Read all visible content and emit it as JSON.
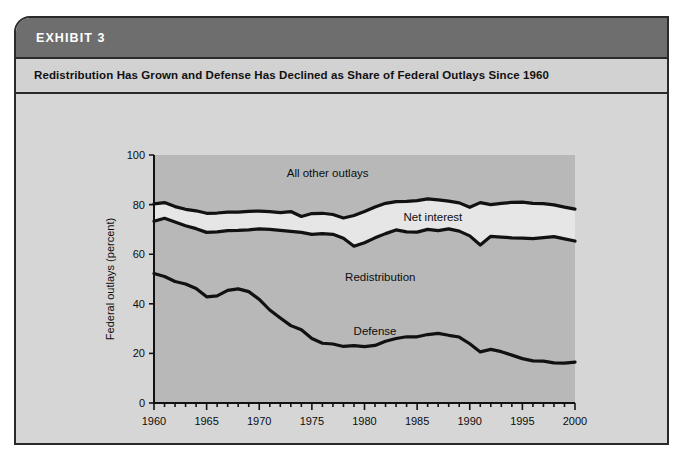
{
  "exhibit": {
    "label": "EXHIBIT 3",
    "subtitle": "Redistribution Has Grown and Defense Has Declined as Share of Federal Outlays Since 1960"
  },
  "colors": {
    "card_background": "#d6d6d6",
    "header_bar": "#6e6e6e",
    "subtitle_bar": "#d2d2d2",
    "border": "#2a2a2a",
    "plot_background": "#b8b8b8",
    "band_fill": "#e6e6e6",
    "line": "#111111",
    "header_text": "#ffffff",
    "body_text": "#111111"
  },
  "chart_data": {
    "type": "area",
    "title": "Redistribution Has Grown and Defense Has Declined as Share of Federal Outlays Since 1960",
    "xlabel": "",
    "ylabel": "Federal outlays (percent)",
    "xlim": [
      1960,
      2000
    ],
    "ylim": [
      0,
      100
    ],
    "grid": false,
    "legend_position": "inline-annotations",
    "x_tick_labels": [
      "1960",
      "1965",
      "1970",
      "1975",
      "1980",
      "1985",
      "1990",
      "1995",
      "2000"
    ],
    "x_tick_values": [
      1960,
      1965,
      1970,
      1975,
      1980,
      1985,
      1990,
      1995,
      2000
    ],
    "x_minor_tick_interval": 1,
    "y_tick_labels": [
      "0",
      "20",
      "40",
      "60",
      "80",
      "100"
    ],
    "y_tick_values": [
      0,
      20,
      40,
      60,
      80,
      100
    ],
    "annotations": [
      {
        "text": "All other outlays",
        "x": 1976.5,
        "y": 91
      },
      {
        "text": "Net interest",
        "x": 1986.5,
        "y": 73.5
      },
      {
        "text": "Redistribution",
        "x": 1981.5,
        "y": 49
      },
      {
        "text": "Defense",
        "x": 1981.0,
        "y": 27.5
      }
    ],
    "x": [
      1960,
      1961,
      1962,
      1963,
      1964,
      1965,
      1966,
      1967,
      1968,
      1969,
      1970,
      1971,
      1972,
      1973,
      1974,
      1975,
      1976,
      1977,
      1978,
      1979,
      1980,
      1981,
      1982,
      1983,
      1984,
      1985,
      1986,
      1987,
      1988,
      1989,
      1990,
      1991,
      1992,
      1993,
      1994,
      1995,
      1996,
      1997,
      1998,
      1999,
      2000
    ],
    "series": [
      {
        "name": "Defense",
        "description": "Defense share of federal outlays (cumulative bottom band)",
        "values": [
          52.2,
          51.0,
          49.0,
          48.0,
          46.2,
          42.8,
          43.2,
          45.4,
          46.0,
          44.9,
          41.8,
          37.5,
          34.3,
          31.2,
          29.5,
          26.0,
          24.1,
          23.8,
          22.8,
          23.1,
          22.7,
          23.2,
          24.9,
          26.0,
          26.7,
          26.7,
          27.6,
          28.1,
          27.3,
          26.6,
          23.9,
          20.6,
          21.6,
          20.7,
          19.3,
          17.9,
          17.0,
          16.9,
          16.2,
          16.1,
          16.5
        ]
      },
      {
        "name": "Redistribution",
        "description": "Cumulative top of Redistribution band (Defense + Redistribution)",
        "values": [
          73.3,
          74.5,
          73.0,
          71.5,
          70.3,
          68.8,
          69.0,
          69.5,
          69.6,
          69.8,
          70.2,
          70.0,
          69.6,
          69.2,
          68.8,
          68.0,
          68.3,
          68.0,
          66.4,
          63.2,
          64.6,
          66.6,
          68.3,
          69.8,
          69.0,
          68.9,
          70.0,
          69.5,
          70.2,
          69.3,
          67.4,
          63.7,
          67.2,
          66.9,
          66.6,
          66.5,
          66.3,
          66.7,
          67.1,
          66.2,
          65.3
        ]
      },
      {
        "name": "Net interest",
        "description": "Cumulative top of Net interest band (Defense + Redistribution + Net interest)",
        "values": [
          80.3,
          80.8,
          79.2,
          78.1,
          77.5,
          76.5,
          76.6,
          77.0,
          77.0,
          77.3,
          77.4,
          77.2,
          76.8,
          77.2,
          75.2,
          76.4,
          76.5,
          76.0,
          74.6,
          75.6,
          77.2,
          79.0,
          80.5,
          81.2,
          81.3,
          81.6,
          82.3,
          81.9,
          81.4,
          80.7,
          78.9,
          80.8,
          80.0,
          80.5,
          80.9,
          81.0,
          80.5,
          80.4,
          79.9,
          79.0,
          78.2
        ]
      },
      {
        "name": "All other outlays",
        "description": "Residual region above the Net interest curve up to 100 percent",
        "values": [
          19.7,
          19.2,
          20.8,
          21.9,
          22.5,
          23.5,
          23.4,
          23.0,
          23.0,
          22.7,
          22.6,
          22.8,
          23.2,
          22.8,
          24.8,
          23.6,
          23.5,
          24.0,
          25.4,
          24.4,
          22.8,
          21.0,
          19.5,
          18.8,
          18.7,
          18.4,
          17.7,
          18.1,
          18.6,
          19.3,
          21.1,
          19.2,
          20.0,
          19.5,
          19.1,
          19.0,
          19.5,
          19.6,
          20.1,
          21.0,
          21.8
        ]
      }
    ]
  }
}
